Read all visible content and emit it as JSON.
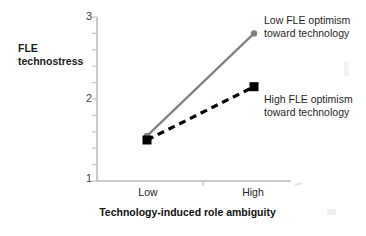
{
  "chart_data": {
    "type": "line",
    "title": "",
    "xlabel": "Technology-induced role ambiguity",
    "ylabel": "FLE technostress",
    "ylabel_lines": [
      "FLE",
      "technostress"
    ],
    "categories": [
      "Low",
      "High"
    ],
    "xticklabels": [
      "Low",
      "High"
    ],
    "yticklabels": [
      "3",
      "2",
      "1"
    ],
    "ytickvalues": [
      3,
      2,
      1
    ],
    "ylim": [
      1,
      3
    ],
    "grid": false,
    "legend_position": "inline-annotations",
    "series": [
      {
        "name": "Low FLE optimism toward technology",
        "label_lines": [
          "Low FLE optimism",
          "toward technology"
        ],
        "values": [
          1.55,
          2.8
        ],
        "color": "#808080",
        "linestyle": "solid",
        "marker": "circle"
      },
      {
        "name": "High FLE optimism toward technology",
        "label_lines": [
          "High FLE optimism",
          "toward technology"
        ],
        "values": [
          1.5,
          2.15
        ],
        "color": "#000000",
        "linestyle": "dashed",
        "marker": "square"
      }
    ],
    "annotations": [
      {
        "text": "Low FLE optimism toward technology",
        "x": "High",
        "y": 2.8
      },
      {
        "text": "High FLE optimism toward technology",
        "x": "High",
        "y": 2.15
      }
    ]
  },
  "axis": {
    "y_tick_3": "3",
    "y_tick_2": "2",
    "y_tick_1": "1",
    "x_tick_low": "Low",
    "x_tick_high": "High"
  },
  "labels": {
    "y_line1": "FLE",
    "y_line2": "technostress",
    "x_title": "Technology-induced role ambiguity"
  },
  "annotations": {
    "low_line1": "Low FLE optimism",
    "low_line2": "toward technology",
    "high_line1": "High FLE optimism",
    "high_line2": "toward technology"
  },
  "colors": {
    "gray_series": "#808080",
    "black_series": "#000000",
    "axis": "#b5b5b5",
    "text": "#1a1a1a"
  }
}
